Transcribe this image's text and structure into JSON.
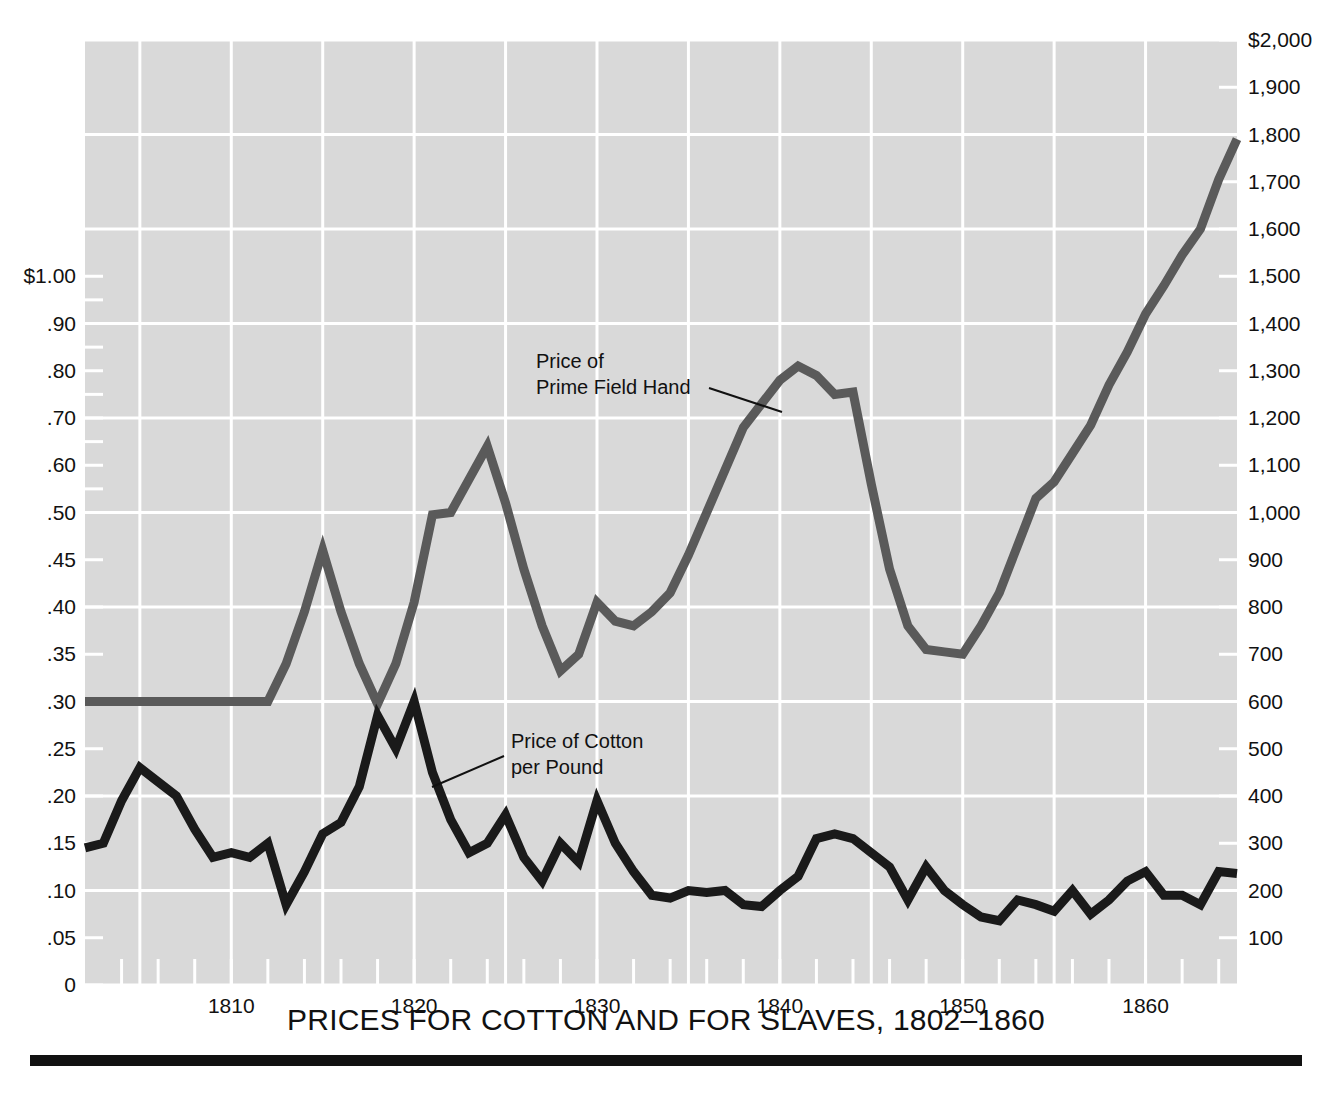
{
  "chart_data": {
    "type": "line",
    "title": "PRICES FOR COTTON AND FOR SLAVES, 1802–1860",
    "xlabel": "",
    "ylabel_left": "",
    "ylabel_right": "",
    "xlim": [
      1802,
      1865
    ],
    "x_tick_labels": [
      "1810",
      "1820",
      "1830",
      "1840",
      "1850",
      "1860"
    ],
    "x_tick_values": [
      1810,
      1820,
      1830,
      1840,
      1850,
      1860
    ],
    "x_minor_tick_step_years": 2,
    "grid": true,
    "legend_position": "inline-annotations",
    "left_axis": {
      "unit": "dollars per pound",
      "tick_labels": [
        "$1.00",
        ".90",
        ".80",
        ".70",
        ".60",
        ".50",
        ".45",
        ".40",
        ".35",
        ".30",
        ".25",
        ".20",
        ".15",
        ".10",
        ".05",
        "0"
      ],
      "tick_values": [
        1.0,
        0.9,
        0.8,
        0.7,
        0.6,
        0.5,
        0.45,
        0.4,
        0.35,
        0.3,
        0.25,
        0.2,
        0.15,
        0.1,
        0.05,
        0
      ],
      "note": "non-linear: below .50 spaced every .05, above .50 spaced every .10"
    },
    "right_axis": {
      "unit": "dollars per prime field hand",
      "tick_labels": [
        "$2,000",
        "1,900",
        "1,800",
        "1,700",
        "1,600",
        "1,500",
        "1,400",
        "1,300",
        "1,200",
        "1,100",
        "1,000",
        "900",
        "800",
        "700",
        "600",
        "500",
        "400",
        "300",
        "200",
        "100"
      ],
      "tick_values": [
        2000,
        1900,
        1800,
        1700,
        1600,
        1500,
        1400,
        1300,
        1200,
        1100,
        1000,
        900,
        800,
        700,
        600,
        500,
        400,
        300,
        200,
        100
      ],
      "ylim": [
        0,
        2000
      ]
    },
    "annotations": [
      {
        "id": "slave-label",
        "text_lines": [
          "Price of",
          "Prime Field Hand"
        ],
        "points_to_year": 1840
      },
      {
        "id": "cotton-label",
        "text_lines": [
          "Price of Cotton",
          "per Pound"
        ],
        "points_to_year": 1821
      }
    ],
    "series": [
      {
        "name": "Price of Cotton per Pound",
        "axis": "left",
        "color": "#1a1a1a",
        "x": [
          1802,
          1803,
          1804,
          1805,
          1806,
          1807,
          1808,
          1809,
          1810,
          1811,
          1812,
          1813,
          1814,
          1815,
          1816,
          1817,
          1818,
          1819,
          1820,
          1821,
          1822,
          1823,
          1824,
          1825,
          1826,
          1827,
          1828,
          1829,
          1830,
          1831,
          1832,
          1833,
          1834,
          1835,
          1836,
          1837,
          1838,
          1839,
          1840,
          1841,
          1842,
          1843,
          1844,
          1845,
          1846,
          1847,
          1848,
          1849,
          1850,
          1851,
          1852,
          1853,
          1854,
          1855,
          1856,
          1857,
          1858,
          1859,
          1860,
          1861,
          1862,
          1863,
          1864,
          1865
        ],
        "values": [
          0.145,
          0.15,
          0.195,
          0.23,
          0.215,
          0.2,
          0.165,
          0.135,
          0.14,
          0.135,
          0.15,
          0.085,
          0.12,
          0.16,
          0.172,
          0.21,
          0.285,
          0.25,
          0.3,
          0.225,
          0.175,
          0.14,
          0.15,
          0.18,
          0.135,
          0.11,
          0.15,
          0.13,
          0.195,
          0.15,
          0.12,
          0.095,
          0.092,
          0.1,
          0.098,
          0.1,
          0.085,
          0.083,
          0.1,
          0.115,
          0.155,
          0.16,
          0.155,
          0.14,
          0.125,
          0.09,
          0.125,
          0.1,
          0.085,
          0.072,
          0.068,
          0.09,
          0.085,
          0.078,
          0.1,
          0.075,
          0.09,
          0.11,
          0.12,
          0.095,
          0.095,
          0.085,
          0.12,
          0.118
        ]
      },
      {
        "name": "Price of Prime Field Hand",
        "axis": "right",
        "color": "#5a5a5a",
        "x": [
          1802,
          1803,
          1804,
          1805,
          1806,
          1807,
          1808,
          1809,
          1810,
          1811,
          1812,
          1813,
          1814,
          1815,
          1816,
          1817,
          1818,
          1819,
          1820,
          1821,
          1822,
          1823,
          1824,
          1825,
          1826,
          1827,
          1828,
          1829,
          1830,
          1831,
          1832,
          1833,
          1834,
          1835,
          1836,
          1837,
          1838,
          1839,
          1840,
          1841,
          1842,
          1843,
          1844,
          1845,
          1846,
          1847,
          1848,
          1849,
          1850,
          1851,
          1852,
          1853,
          1854,
          1855,
          1856,
          1857,
          1858,
          1859,
          1860,
          1861,
          1862,
          1863,
          1864,
          1865
        ],
        "values": [
          600,
          600,
          600,
          600,
          600,
          600,
          600,
          600,
          600,
          600,
          600,
          680,
          790,
          920,
          790,
          680,
          595,
          680,
          810,
          995,
          1000,
          1070,
          1140,
          1020,
          880,
          760,
          665,
          700,
          810,
          770,
          760,
          790,
          830,
          910,
          1000,
          1090,
          1180,
          1230,
          1280,
          1310,
          1290,
          1250,
          1255,
          1060,
          880,
          760,
          710,
          705,
          700,
          760,
          830,
          930,
          1030,
          1065,
          1125,
          1185,
          1270,
          1340,
          1420,
          1480,
          1545,
          1600,
          1705,
          1790
        ]
      }
    ]
  },
  "figure": {
    "title_text": "PRICES FOR COTTON AND FOR SLAVES, 1802–1860",
    "bottom_rule": true
  },
  "colors": {
    "plot_background": "#d9d9d9",
    "grid": "#ffffff",
    "cotton_line": "#1a1a1a",
    "slave_line": "#5a5a5a",
    "text": "#111111",
    "page_background": "#ffffff"
  },
  "annotation_text": {
    "slave_line1": "Price of",
    "slave_line2": "Prime Field Hand",
    "cotton_line1": "Price of Cotton",
    "cotton_line2": "per Pound"
  }
}
